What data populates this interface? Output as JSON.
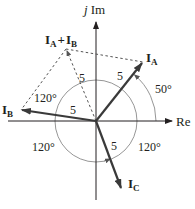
{
  "diagram": {
    "type": "phasor-diagram",
    "axes": {
      "imag_label_j": "j",
      "imag_label": "Im",
      "real_label": "Re"
    },
    "phasors": [
      {
        "id": "IA",
        "main": "I",
        "sub": "A",
        "magnitude_label": "5",
        "angle_deg": 50
      },
      {
        "id": "IB",
        "main": "I",
        "sub": "B",
        "magnitude_label": "5",
        "angle_deg": 170
      },
      {
        "id": "IC",
        "main": "I",
        "sub": "C",
        "magnitude_label": "5",
        "angle_deg": -70
      }
    ],
    "sum": {
      "main1": "I",
      "sub1": "A",
      "plus": "+",
      "main2": "I",
      "sub2": "B",
      "magnitude_label": "5"
    },
    "angles": {
      "a50": "50°",
      "a120_top": "120°",
      "a120_left": "120°",
      "a120_right": "120°"
    },
    "colors": {
      "phasor": "#3a3a3a",
      "axis": "#231f20",
      "arc": "#8a8a8a"
    }
  }
}
